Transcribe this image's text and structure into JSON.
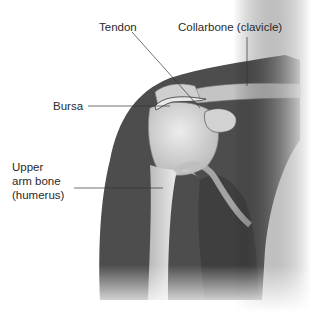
{
  "diagram": {
    "labels": [
      {
        "id": "tendon",
        "text": "Tendon"
      },
      {
        "id": "collarbone",
        "text": "Collarbone (clavicle)"
      },
      {
        "id": "bursa",
        "text": "Bursa"
      },
      {
        "id": "humerus",
        "text": "Upper\narm bone\n(humerus)"
      }
    ]
  },
  "colors": {
    "background": "#ffffff",
    "skin_dark": "#4a4a4a",
    "bone_light": "#d9d9d9",
    "label_text": "#2a2a2a",
    "leader_line": "#333333"
  }
}
